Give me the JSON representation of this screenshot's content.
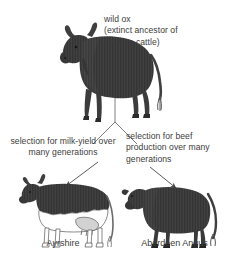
{
  "diagram": {
    "type": "selective-breeding-tree",
    "background_color": "#ffffff",
    "ink_color": "#3c3c3c",
    "animal_fill_color": "#3f3f3f",
    "ancestor": {
      "name": "wild ox",
      "label": "wild ox\n(extinct ancestor of\nmodern cattle)"
    },
    "branches": [
      {
        "side": "left",
        "selection_label": "selection for milk-yield over\nmany generations",
        "result_caption": "Ayrshire",
        "trait": "milk-yield"
      },
      {
        "side": "right",
        "selection_label": "selection for beef\nproduction over many\ngenerations",
        "result_caption": "Aberdeen Angus",
        "trait": "beef production"
      }
    ],
    "icons": {
      "wild_ox": "wild-ox-icon",
      "ayrshire": "ayrshire-cow-icon",
      "angus": "aberdeen-angus-bull-icon",
      "left_arrow": "arrow-down-left-icon",
      "right_arrow": "arrow-down-right-icon",
      "fork": "branch-fork-icon"
    }
  }
}
